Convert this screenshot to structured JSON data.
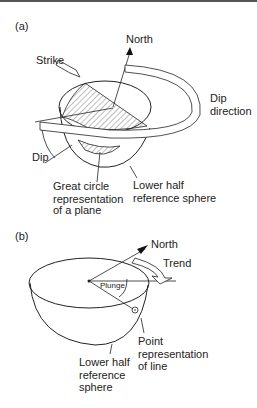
{
  "panel_a": {
    "label": "(a)",
    "north": "North",
    "strike": "Strike",
    "dip_direction_1": "Dip",
    "dip_direction_2": "direction",
    "dip": "Dip",
    "great_circle_1": "Great circle",
    "great_circle_2": "representation",
    "great_circle_3": "of a plane",
    "lower_half_1": "Lower half",
    "lower_half_2": "reference sphere"
  },
  "panel_b": {
    "label": "(b)",
    "north": "North",
    "trend": "Trend",
    "plunge": "Plunge",
    "point_1": "Point",
    "point_2": "representation",
    "point_3": "of line",
    "lower_half_1": "Lower half",
    "lower_half_2": "reference",
    "lower_half_3": "sphere"
  }
}
